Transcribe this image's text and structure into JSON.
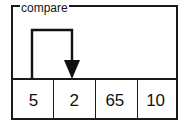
{
  "figure": {
    "caption": "compare",
    "array": {
      "cells": [
        {
          "value": "5"
        },
        {
          "value": "2"
        },
        {
          "value": "65"
        },
        {
          "value": "10"
        }
      ]
    },
    "arrow": {
      "name": "compare-arrow",
      "from_cell_index": 0,
      "to_cell_index": 1,
      "direction": "down",
      "color": "#111111"
    },
    "colors": {
      "border": "#1a1a1a",
      "background": "#ffffff",
      "text": "#111111"
    }
  }
}
